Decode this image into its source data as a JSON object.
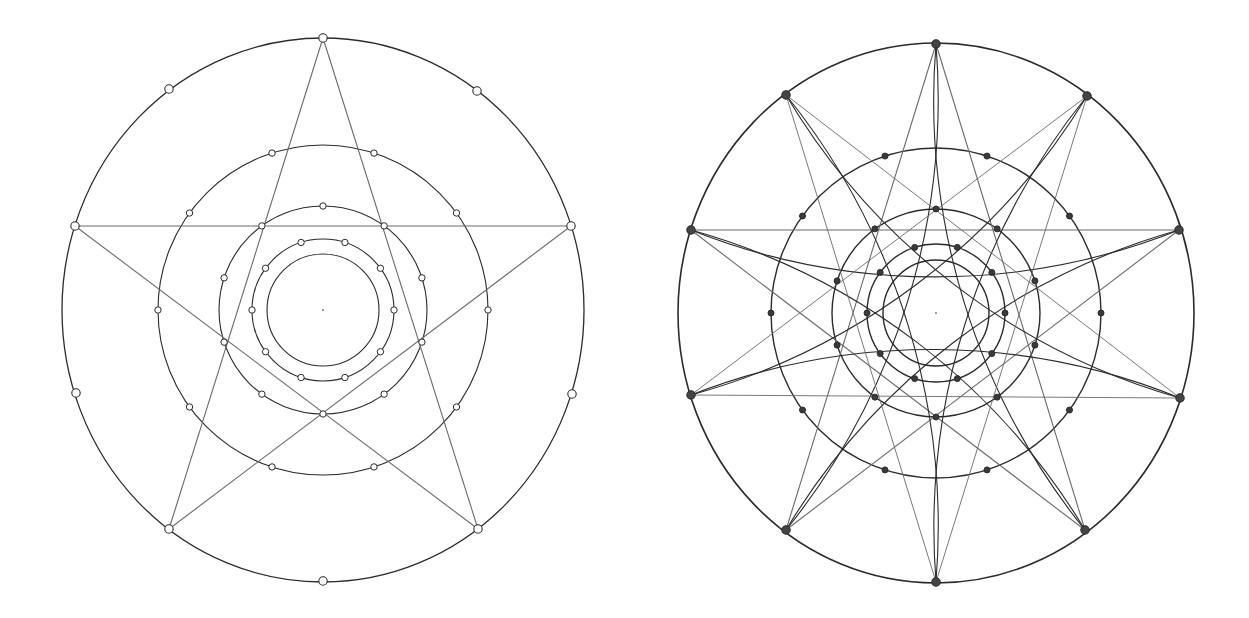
{
  "stroke_color": "#2b2b2b",
  "light_stroke_color": "#6a6a6a",
  "background": "#ffffff",
  "figures": [
    {
      "id": "left",
      "label": "Pentagram inscribed in concentric circles",
      "center": [
        323,
        310
      ],
      "outer": {
        "rx": 261,
        "ry": 272
      },
      "circles": [
        {
          "r": 56,
          "dots": 0
        },
        {
          "r": 71,
          "dots": 10,
          "offset_deg": -72
        },
        {
          "r": 104,
          "dots": 5,
          "offset_deg": -90,
          "extra_dots": 5,
          "extra_offset_deg": -54
        },
        {
          "r": 165,
          "dots": 10,
          "offset_deg": -72
        }
      ],
      "outer_points": [
        [
          323,
          38
        ],
        [
          477,
          91
        ],
        [
          571,
          226
        ],
        [
          572,
          394
        ],
        [
          478,
          529
        ],
        [
          323,
          581
        ],
        [
          169,
          529
        ],
        [
          76,
          393
        ],
        [
          75,
          226
        ],
        [
          169,
          89
        ]
      ],
      "pentagram": [
        [
          323,
          38
        ],
        [
          478,
          529
        ],
        [
          75,
          226
        ],
        [
          571,
          226
        ],
        [
          169,
          529
        ]
      ],
      "arcs": false
    },
    {
      "id": "right",
      "label": "Ten-point rosette with interlaced arcs",
      "center": [
        936,
        313
      ],
      "outer": {
        "rx": 258,
        "ry": 270
      },
      "circles": [
        {
          "r": 53,
          "dots": 0
        },
        {
          "r": 69,
          "dots": 10,
          "offset_deg": -72
        },
        {
          "r": 104,
          "dots": 10,
          "offset_deg": -90
        },
        {
          "r": 165,
          "dots": 10,
          "offset_deg": -72
        }
      ],
      "outer_points": [
        [
          936,
          44
        ],
        [
          1087,
          96
        ],
        [
          1179,
          230
        ],
        [
          1180,
          398
        ],
        [
          1085,
          530
        ],
        [
          936,
          582
        ],
        [
          786,
          530
        ],
        [
          691,
          395
        ],
        [
          691,
          230
        ],
        [
          786,
          95
        ]
      ],
      "pentagram": [
        [
          936,
          44
        ],
        [
          1085,
          530
        ],
        [
          691,
          230
        ],
        [
          1179,
          230
        ],
        [
          786,
          530
        ]
      ],
      "arcs": true
    }
  ]
}
